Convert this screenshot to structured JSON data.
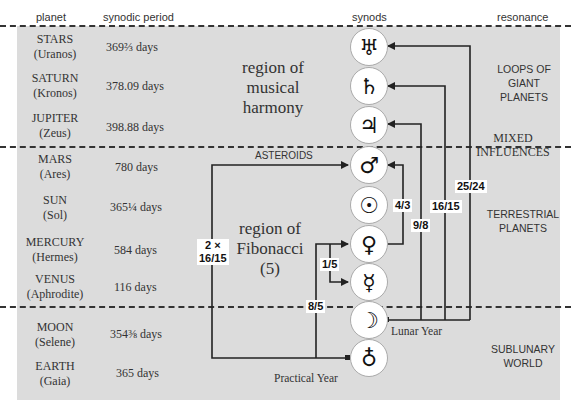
{
  "header": {
    "planet": "planet",
    "synodic_period": "synodic period",
    "synods": "synods",
    "resonance": "resonance"
  },
  "planets": [
    {
      "name": "STARS",
      "deity": "(Uranos)",
      "period": "369⅔ days",
      "symbol": "♅"
    },
    {
      "name": "SATURN",
      "deity": "(Kronos)",
      "period": "378.09 days",
      "symbol": "♄"
    },
    {
      "name": "JUPITER",
      "deity": "(Zeus)",
      "period": "398.88 days",
      "symbol": "♃"
    },
    {
      "name": "MARS",
      "deity": "(Ares)",
      "period": "780 days",
      "symbol": "♂"
    },
    {
      "name": "SUN",
      "deity": "(Sol)",
      "period": "365¼ days",
      "symbol": "☉"
    },
    {
      "name": "MERCURY",
      "deity": "(Hermes)",
      "period": "584 days",
      "symbol": "♀"
    },
    {
      "name": "VENUS",
      "deity": "(Aphrodite)",
      "period": "116 days",
      "symbol": "☿"
    },
    {
      "name": "MOON",
      "deity": "(Selene)",
      "period": "354⅜ days",
      "symbol": "☽"
    },
    {
      "name": "EARTH",
      "deity": "(Gaia)",
      "period": "365 days",
      "symbol": "♁"
    }
  ],
  "regions": {
    "musical": [
      "region of",
      "musical",
      "harmony"
    ],
    "fibonacci": [
      "region of",
      "Fibonacci",
      "(5)"
    ]
  },
  "resonance_labels": {
    "giant": [
      "LOOPS OF",
      "GIANT",
      "PLANETS"
    ],
    "mixed": [
      "MIXED",
      "INFLUENCES"
    ],
    "terrestrial": [
      "TERRESTRIAL",
      "PLANETS"
    ],
    "sublunary": [
      "SUBLUNARY",
      "WORLD"
    ]
  },
  "ratios": {
    "r_25_24": "25/24",
    "r_16_15": "16/15",
    "r_9_8": "9/8",
    "r_4_3": "4/3",
    "r_1_5": "1/5",
    "r_8_5": "8/5",
    "r_2x_line1": "2 ×",
    "r_2x_line2": "16/15"
  },
  "annotations": {
    "asteroids": "ASTEROIDS",
    "lunar_year": "Lunar Year",
    "practical_year": "Practical Year"
  },
  "colors": {
    "panel": "#dcdcdc",
    "line": "#222222",
    "circle_fill": "#ffffff"
  }
}
